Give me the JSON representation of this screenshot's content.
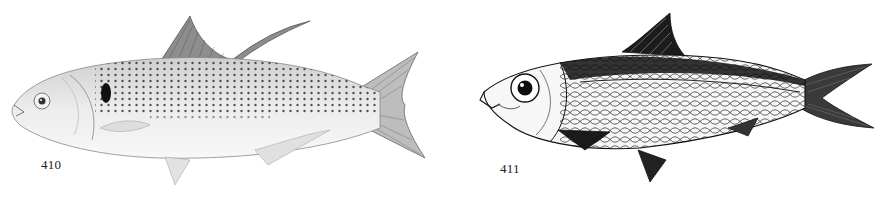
{
  "plate": {
    "figures": [
      {
        "number": "410",
        "subject": "fish-illustration",
        "style": "light stippled grey drawing, dark spot behind gill, rows of dark dots, elongated dorsal filament"
      },
      {
        "number": "411",
        "subject": "fish-illustration",
        "style": "dark pen-and-ink drawing, large eye, reticulate scale pattern, dark dorsal band, forked tail"
      }
    ]
  },
  "colors": {
    "background": "#ffffff",
    "ink_dark": "#111111",
    "ink_light": "#9a9a9a"
  }
}
